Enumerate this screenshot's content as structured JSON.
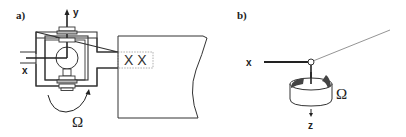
{
  "figure": {
    "panel_a": {
      "label": "a)",
      "axis_y": "y",
      "axis_x": "x",
      "rotation_symbol": "Ω",
      "coupling_marks": "X X"
    },
    "panel_b": {
      "label": "b)",
      "axis_x": "x",
      "axis_z": "z",
      "rotation_symbol": "Ω"
    }
  },
  "colors": {
    "line": "#333333",
    "light_line": "#777777",
    "dotted": "#999999",
    "fill_dark": "#444444"
  }
}
